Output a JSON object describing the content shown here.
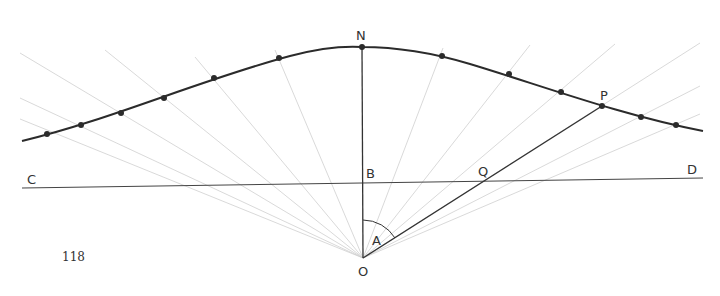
{
  "figure": {
    "page_number": "118",
    "labels": {
      "N": "N",
      "C": "C",
      "B": "B",
      "Q": "Q",
      "D": "D",
      "P": "P",
      "A": "A",
      "O": "O"
    },
    "colors": {
      "ink": "#333333",
      "faint": "#c8c8c8",
      "background": "#ffffff"
    },
    "points": {
      "N": [
        362,
        47
      ],
      "O": [
        363,
        258
      ],
      "B": [
        363,
        182
      ],
      "P": [
        602,
        106
      ],
      "Q": [
        487,
        179
      ],
      "C_end": [
        22,
        188
      ],
      "D_end": [
        703,
        178
      ]
    },
    "curve_dots": [
      [
        47,
        134
      ],
      [
        81,
        125
      ],
      [
        121,
        113
      ],
      [
        164,
        98
      ],
      [
        214,
        78
      ],
      [
        279,
        58
      ],
      [
        362,
        47
      ],
      [
        442,
        56
      ],
      [
        509,
        74
      ],
      [
        561,
        92
      ],
      [
        602,
        106
      ],
      [
        641,
        117
      ],
      [
        676,
        125
      ]
    ]
  }
}
